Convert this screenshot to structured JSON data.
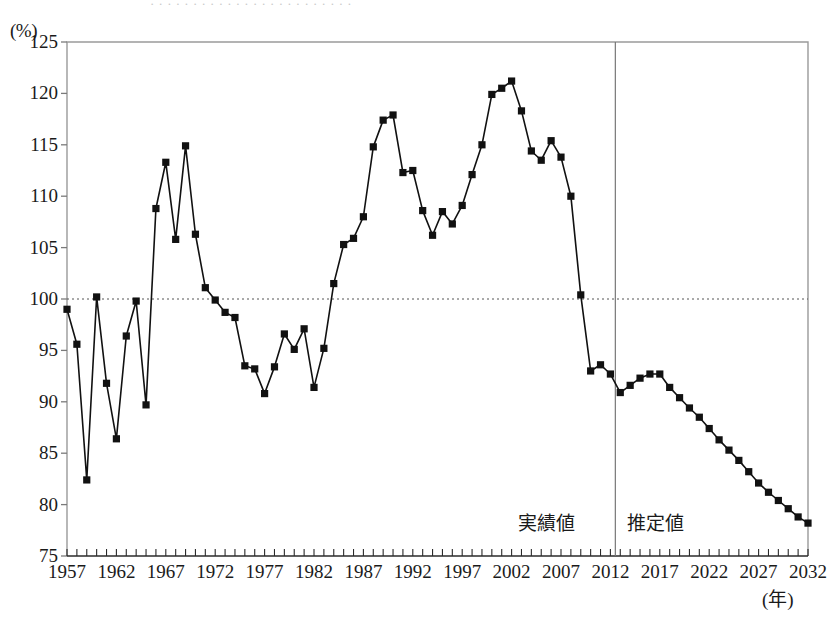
{
  "chart_data": {
    "type": "line",
    "title": "",
    "subtitle": "",
    "xlabel": "(年)",
    "ylabel": "(%)",
    "xlim": [
      1957,
      2032
    ],
    "ylim": [
      75,
      125
    ],
    "yticks": [
      75,
      80,
      85,
      90,
      95,
      100,
      105,
      110,
      115,
      120,
      125
    ],
    "xticks": [
      1957,
      1962,
      1967,
      1972,
      1977,
      1982,
      1987,
      1992,
      1997,
      2002,
      2007,
      2012,
      2017,
      2022,
      2027,
      2032
    ],
    "xtick_minor_step": 1,
    "grid": false,
    "reference_line": {
      "value": 100,
      "style": "dotted",
      "color": "#555555"
    },
    "divider": {
      "x": 2012.5,
      "label_left": "実績値",
      "label_right": "推定値",
      "color": "#666666"
    },
    "marker": "square",
    "marker_color": "#111111",
    "line_color": "#111111",
    "legend_position": "none",
    "annotations": [
      {
        "text": "実績値",
        "x": 2006.5,
        "y": 78.5
      },
      {
        "text": "推定値",
        "x": 2017.5,
        "y": 78.5
      }
    ],
    "series": [
      {
        "name": "",
        "x": [
          1957,
          1958,
          1959,
          1960,
          1961,
          1962,
          1963,
          1964,
          1965,
          1966,
          1967,
          1968,
          1969,
          1970,
          1971,
          1972,
          1973,
          1974,
          1975,
          1976,
          1977,
          1978,
          1979,
          1980,
          1981,
          1982,
          1983,
          1984,
          1985,
          1986,
          1987,
          1988,
          1989,
          1990,
          1991,
          1992,
          1993,
          1994,
          1995,
          1996,
          1997,
          1998,
          1999,
          2000,
          2001,
          2002,
          2003,
          2004,
          2005,
          2006,
          2007,
          2008,
          2009,
          2010,
          2011,
          2012,
          2013,
          2014,
          2015,
          2016,
          2017,
          2018,
          2019,
          2020,
          2021,
          2022,
          2023,
          2024,
          2025,
          2026,
          2027,
          2028,
          2029,
          2030,
          2031,
          2032
        ],
        "values": [
          99.0,
          95.6,
          82.4,
          100.2,
          91.8,
          86.4,
          96.4,
          99.8,
          89.7,
          108.8,
          113.3,
          105.8,
          114.9,
          106.3,
          101.1,
          99.9,
          98.7,
          98.2,
          93.5,
          93.2,
          90.8,
          93.4,
          96.6,
          95.1,
          97.1,
          91.4,
          95.2,
          101.5,
          105.3,
          105.9,
          108.0,
          114.8,
          117.4,
          117.9,
          112.3,
          112.5,
          108.6,
          106.2,
          108.5,
          107.3,
          109.1,
          112.1,
          115.0,
          119.9,
          120.5,
          121.2,
          118.3,
          114.4,
          113.5,
          115.4,
          113.8,
          110.0,
          100.4,
          93.0,
          93.6,
          92.7,
          90.9,
          91.6,
          92.3,
          92.7,
          92.7,
          91.4,
          90.4,
          89.4,
          88.5,
          87.4,
          86.3,
          85.3,
          84.3,
          83.2,
          82.1,
          81.2,
          80.4,
          79.6,
          78.8,
          78.2
        ]
      }
    ]
  },
  "axis": {
    "y_unit": "(%)",
    "x_unit": "(年)",
    "y_tick_labels": [
      "125",
      "120",
      "115",
      "110",
      "105",
      "100",
      "95",
      "90",
      "85",
      "80",
      "75"
    ],
    "x_tick_labels": [
      "1957",
      "1962",
      "1967",
      "1972",
      "1977",
      "1982",
      "1987",
      "1992",
      "1997",
      "2002",
      "2007",
      "2012",
      "2017",
      "2022",
      "2027",
      "2032"
    ]
  },
  "annotations": {
    "actual": "実績値",
    "estimate": "推定値"
  },
  "colors": {
    "line": "#111111",
    "marker": "#111111",
    "axis": "#9a9a9a",
    "reference": "#555555",
    "divider": "#777777",
    "text": "#1a1a1a"
  }
}
